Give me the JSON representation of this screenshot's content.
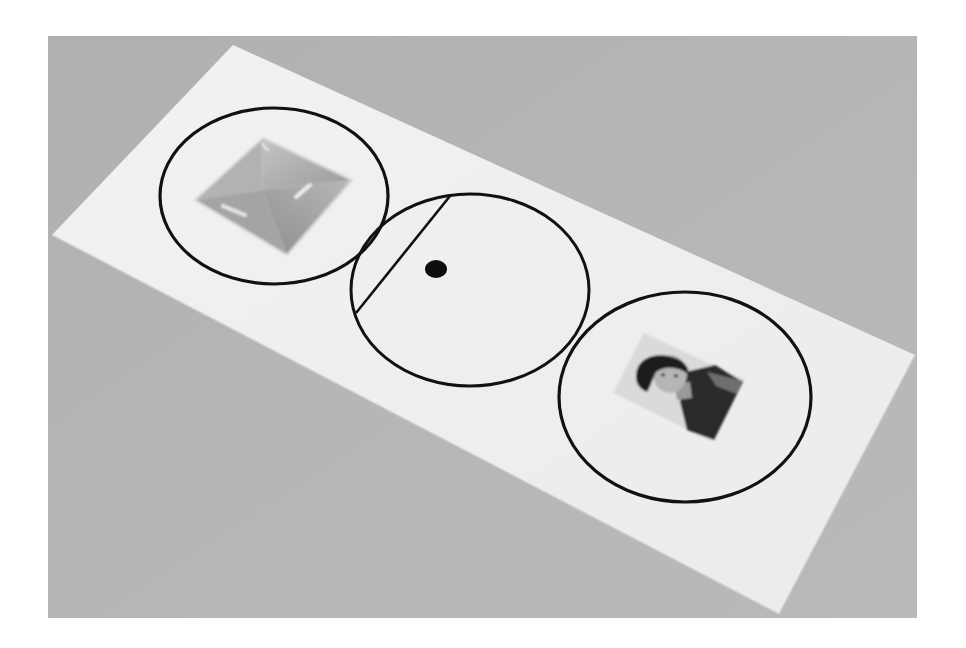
{
  "image": {
    "description": "Photograph of a white paper strip lying diagonally on a grey surface, printed with three overlapping black circles: the left circle holds a clear glass pyramid, the middle circle contains a chord line and a black dot, the right circle holds a small portrait photo of a person.",
    "colors": {
      "canvas": "#ffffff",
      "background_surface": "#b3b3b3",
      "paper": "#efefef",
      "ink": "#111111",
      "glass": "#a9a9a9",
      "photo_background": "#dcdcdc"
    }
  },
  "scene": {
    "frame": {
      "x": 48,
      "y": 36,
      "width": 869,
      "height": 582
    },
    "paper": {
      "points": "233,45 915,355 779,614 52,235"
    },
    "circles": [
      {
        "id": "left",
        "cx": 274,
        "cy": 196,
        "rx": 114,
        "ry": 88,
        "content": "glass-pyramid"
      },
      {
        "id": "middle",
        "cx": 470,
        "cy": 290,
        "rx": 119,
        "ry": 96,
        "content": "chord-and-dot"
      },
      {
        "id": "right",
        "cx": 685,
        "cy": 397,
        "rx": 126,
        "ry": 105,
        "content": "portrait-photo"
      }
    ],
    "chord": {
      "x1": 450,
      "y1": 196,
      "x2": 356,
      "y2": 313
    },
    "dot": {
      "cx": 436,
      "cy": 269,
      "rx": 11,
      "ry": 9
    },
    "pyramid": {
      "points": "195,200 263,138 352,180 287,255",
      "apex": "262,190"
    },
    "portrait": {
      "points": "613,393 644,333 745,380 711,441"
    }
  }
}
